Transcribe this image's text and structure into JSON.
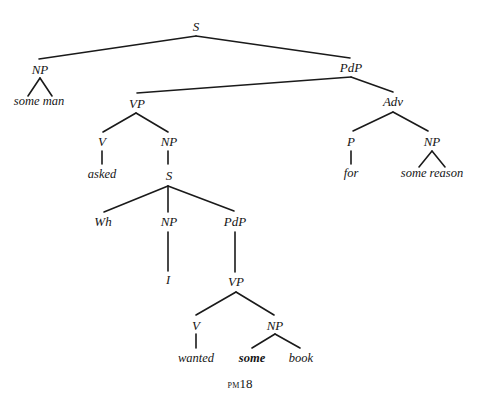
{
  "diagram": {
    "type": "syntax-tree",
    "caption_prefix": "pm",
    "caption_number": "18",
    "nodes": {
      "root_s": "S",
      "subj_np": "NP",
      "subj_leaf": "some man",
      "pred_pdp": "PdP",
      "vp": "VP",
      "v": "V",
      "v_leaf": "asked",
      "obj_np": "NP",
      "emb_s": "S",
      "wh": "Wh",
      "emb_np": "NP",
      "emb_np_leaf": "I",
      "emb_pdp": "PdP",
      "emb_vp": "VP",
      "emb_v": "V",
      "emb_v_leaf": "wanted",
      "emb_obj_np": "NP",
      "emb_obj_leaf_1": "some",
      "emb_obj_leaf_2": "book",
      "adv": "Adv",
      "p": "P",
      "p_leaf": "for",
      "adv_np": "NP",
      "adv_np_leaf": "some reason"
    },
    "edges": [
      [
        "S",
        "NP"
      ],
      [
        "S",
        "PdP"
      ],
      [
        "NP",
        "some man"
      ],
      [
        "PdP",
        "VP"
      ],
      [
        "PdP",
        "Adv"
      ],
      [
        "VP",
        "V"
      ],
      [
        "VP",
        "NP"
      ],
      [
        "V",
        "asked"
      ],
      [
        "NP",
        "S"
      ],
      [
        "S",
        "Wh"
      ],
      [
        "S",
        "NP"
      ],
      [
        "S",
        "PdP"
      ],
      [
        "NP",
        "I"
      ],
      [
        "PdP",
        "VP"
      ],
      [
        "VP",
        "V"
      ],
      [
        "VP",
        "NP"
      ],
      [
        "V",
        "wanted"
      ],
      [
        "NP",
        "some"
      ],
      [
        "NP",
        "book"
      ],
      [
        "Adv",
        "P"
      ],
      [
        "Adv",
        "NP"
      ],
      [
        "P",
        "for"
      ],
      [
        "NP",
        "some reason"
      ]
    ]
  }
}
